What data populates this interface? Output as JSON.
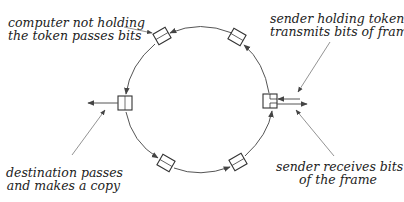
{
  "diagram": {
    "colors": {
      "line": "#555555",
      "box": "#333333",
      "text": "#222222",
      "background": "#ffffff"
    },
    "ring": {
      "cx": 200,
      "cy": 102,
      "rx": 75,
      "ry": 80,
      "direction": "counterclockwise"
    },
    "stations": [
      {
        "id": "top-left",
        "x": 162,
        "y": 36,
        "angle": -30
      },
      {
        "id": "top-right",
        "x": 237,
        "y": 37,
        "angle": 30
      },
      {
        "id": "left",
        "x": 125,
        "y": 103,
        "angle": 0,
        "role": "destination"
      },
      {
        "id": "right",
        "x": 270,
        "y": 101,
        "angle": 0,
        "role": "sender"
      },
      {
        "id": "bottom-left",
        "x": 166,
        "y": 163,
        "angle": 30
      },
      {
        "id": "bottom-right",
        "x": 238,
        "y": 162,
        "angle": -30
      }
    ],
    "labels": {
      "passes_bits": [
        "computer not holding",
        "the token passes bits"
      ],
      "sender_transmits": [
        "sender holding token",
        "transmits bits of frame"
      ],
      "destination_copy": [
        "destination passes",
        "and makes a copy"
      ],
      "sender_receives": [
        "sender receives bits",
        "of the frame"
      ]
    }
  }
}
